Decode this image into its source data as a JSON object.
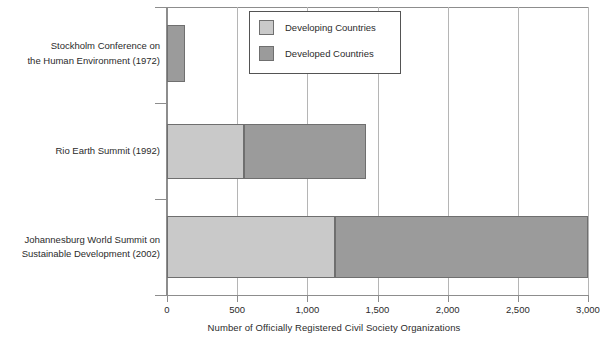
{
  "chart_data": {
    "type": "bar",
    "orientation": "horizontal",
    "stacked": true,
    "title": "",
    "subtitle": "",
    "xlabel": "Number of Officially Registered Civil Society Organizations",
    "ylabel": "",
    "xlim": [
      0,
      3000
    ],
    "xticks": [
      0,
      500,
      1000,
      1500,
      2000,
      2500,
      3000
    ],
    "xtick_labels": [
      "0",
      "500",
      "1,000",
      "1,500",
      "2,000",
      "2,500",
      "3,000"
    ],
    "grid": true,
    "grid_axis": "x",
    "legend_position": "top-center",
    "categories": [
      "Stockholm Conference on the Human Environment (1972)",
      "Rio Earth Summit (1992)",
      "Johannesburg World Summit on Sustainable Development (2002)"
    ],
    "category_label_lines": [
      [
        "Stockholm Conference on",
        "the Human Environment (1972)"
      ],
      [
        "Rio Earth Summit (1992)"
      ],
      [
        "Johannesburg World Summit on",
        "Sustainable Development (2002)"
      ]
    ],
    "series": [
      {
        "name": "Developing Countries",
        "color": "#c9c9c9",
        "values": [
          0,
          550,
          1200
        ]
      },
      {
        "name": "Developed Countries",
        "color": "#9b9b9b",
        "values": [
          130,
          870,
          1800
        ]
      }
    ],
    "totals": [
      130,
      1420,
      3000
    ]
  },
  "legend": {
    "items": [
      {
        "label": "Developing Countries",
        "color": "#c9c9c9"
      },
      {
        "label": "Developed Countries",
        "color": "#9b9b9b"
      }
    ]
  },
  "axis": {
    "x_title": "Number of Officially Registered Civil Society Organizations",
    "tick_labels": [
      "0",
      "500",
      "1,000",
      "1,500",
      "2,000",
      "2,500",
      "3,000"
    ]
  },
  "colors": {
    "developing": "#c9c9c9",
    "developed": "#9b9b9b",
    "bar_border": "#6f6f6f",
    "axis": "#8d8d8d",
    "grid": "#b5b5b5",
    "text": "#2b2b2b",
    "background": "#ffffff"
  }
}
